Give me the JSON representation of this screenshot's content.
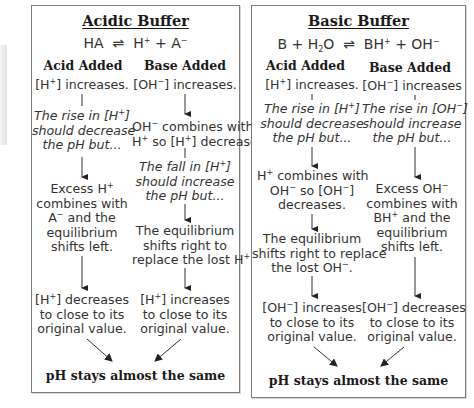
{
  "acidic_buffer": {
    "title": "Acidic Buffer",
    "equation": {
      "left": "HA",
      "arrow": "⇌",
      "right_1": "H",
      "right_1_sup": "+",
      "plus": " + ",
      "right_2": "A",
      "right_2_sup": "−"
    },
    "acid_added": {
      "heading": "Acid Added",
      "steps": [
        "[H+] increases.",
        "The rise in [H+] should decrease the pH but...",
        "Excess H+ combines with A− and the equilibrium shifts left.",
        "[H+] decreases to close to its original value."
      ]
    },
    "base_added": {
      "heading": "Base Added",
      "steps": [
        "[OH−] increases.",
        "OH− combines with H+ so [H+] decreases.",
        "The fall in [H+] should increase the pH but...",
        "The equilibrium shifts right to replace the lost H+.",
        "[H+] increases to close to its original value."
      ]
    },
    "conclusion": "pH stays almost the same"
  },
  "basic_buffer": {
    "title": "Basic Buffer",
    "equation": "B + H2O ⇌ BH+ + OH−",
    "acid_added": {
      "heading": "Acid Added",
      "steps": [
        "[H+] increases.",
        "The rise in [H+] should decrease the pH but...",
        "H+ combines with OH− so [OH−] decreases.",
        "The equilibrium shifts right to replace the lost OH−.",
        "[OH−] increases to close to its original value."
      ]
    },
    "base_added": {
      "heading": "Base Added",
      "steps": [
        "[OH−] increases",
        "The rise in [OH−] should increase the pH but...",
        "Excess OH− combines with BH+ and the equilibrium shifts left.",
        "[OH−] decreases to close to its original value."
      ]
    },
    "conclusion": "pH stays almost the same"
  },
  "colors": {
    "border": "#7d7d7d",
    "text": "#333333",
    "arrow": "#222222"
  }
}
